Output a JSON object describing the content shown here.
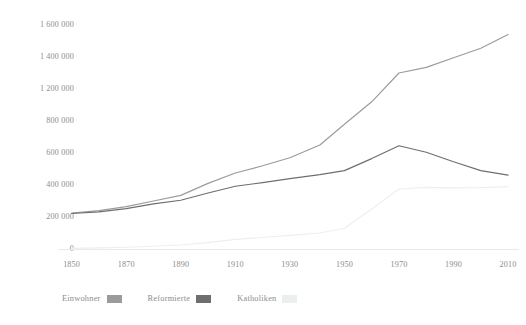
{
  "chart_data": {
    "type": "line",
    "title": "",
    "subtitle": "",
    "xlabel": "",
    "ylabel": "",
    "x": [
      1850,
      1860,
      1870,
      1880,
      1890,
      1900,
      1910,
      1920,
      1930,
      1941,
      1950,
      1960,
      1970,
      1980,
      1990,
      2000,
      2010
    ],
    "xlim": [
      1845,
      2014
    ],
    "ylim": [
      0,
      1600000
    ],
    "grid": false,
    "legend_position": "bottom-left",
    "xticks": [
      "1850",
      "1870",
      "1890",
      "1910",
      "1930",
      "1950",
      "1970",
      "1990",
      "2010"
    ],
    "xtick_values": [
      1850,
      1870,
      1890,
      1910,
      1930,
      1950,
      1970,
      1990,
      2010
    ],
    "yticks": [
      "0",
      "200 000",
      "400 000",
      "600 000",
      "800 000",
      "1 200 000",
      "1 400 000",
      "1 600 000"
    ],
    "ytick_values": [
      0,
      200000,
      400000,
      600000,
      800000,
      1200000,
      1400000,
      1600000
    ],
    "series": [
      {
        "name": "Einwohner",
        "color": "#9b9b9b",
        "values": [
          225000,
          240000,
          265000,
          300000,
          335000,
          410000,
          475000,
          520000,
          570000,
          650000,
          780000,
          1040000,
          1300000,
          1335000,
          1395000,
          1455000,
          1540000
        ]
      },
      {
        "name": "Reformierte",
        "color": "#6e6e6e",
        "values": [
          222000,
          232000,
          252000,
          282000,
          305000,
          350000,
          392000,
          415000,
          440000,
          465000,
          490000,
          565000,
          645000,
          605000,
          545000,
          490000,
          462000
        ]
      },
      {
        "name": "Katholiken",
        "color": "#eceff0",
        "values": [
          4000,
          7000,
          11000,
          17000,
          25000,
          40000,
          60000,
          72000,
          85000,
          100000,
          130000,
          250000,
          375000,
          385000,
          382000,
          384000,
          390000
        ]
      }
    ]
  },
  "legend": {
    "entries": [
      {
        "label": "Einwohner",
        "color": "#9b9b9b"
      },
      {
        "label": "Reformierte",
        "color": "#6e6e6e"
      },
      {
        "label": "Katholiken",
        "color": "#eceff0"
      }
    ]
  },
  "axis": {
    "baseline_color": "#e9e9e9"
  }
}
